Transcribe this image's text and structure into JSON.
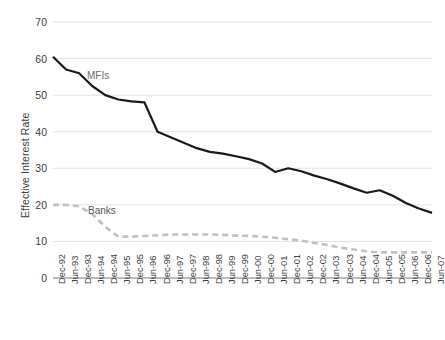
{
  "chart_data": {
    "type": "line",
    "title": "",
    "xlabel": "",
    "ylabel": "Effective Interest Rate",
    "ylim": [
      0,
      70
    ],
    "yticks": [
      0,
      10,
      20,
      30,
      40,
      50,
      60,
      70
    ],
    "grid": true,
    "legend_position": "inline-annotation",
    "categories": [
      "Dec-92",
      "Jun-93",
      "Dec-93",
      "Jun-94",
      "Dec-94",
      "Jun-95",
      "Dec-95",
      "Jun-96",
      "Dec-96",
      "Jun-97",
      "Dec-97",
      "Jun-98",
      "Dec-98",
      "Jun-99",
      "Dec-99",
      "Jun-00",
      "Dec-00",
      "Jun-01",
      "Dec-01",
      "Jun-02",
      "Dec-02",
      "Jun-03",
      "Dec-03",
      "Jun-04",
      "Dec-04",
      "Jun-05",
      "Dec-05",
      "Jun-06",
      "Dec-06",
      "Jun-07"
    ],
    "series": [
      {
        "name": "MFIs",
        "style": "solid",
        "color": "#1a1a1a",
        "values": [
          60.5,
          57.0,
          56.0,
          52.5,
          50.0,
          48.8,
          48.3,
          48.0,
          40.0,
          38.5,
          37.0,
          35.5,
          34.5,
          34.0,
          33.3,
          32.5,
          31.3,
          29.0,
          30.0,
          29.2,
          28.0,
          27.0,
          25.8,
          24.5,
          23.3,
          24.0,
          22.5,
          20.5,
          19.0,
          17.8
        ]
      },
      {
        "name": "Banks",
        "style": "dashed",
        "color": "#c2c2c2",
        "values": [
          20.0,
          20.0,
          19.6,
          17.5,
          14.0,
          11.3,
          11.3,
          11.5,
          11.7,
          11.9,
          11.9,
          11.9,
          11.9,
          11.8,
          11.6,
          11.5,
          11.3,
          11.0,
          10.6,
          10.2,
          9.6,
          9.0,
          8.3,
          7.8,
          7.3,
          7.0,
          7.0,
          7.0,
          7.0,
          7.0
        ]
      }
    ],
    "annotations": [
      {
        "text": "MFIs",
        "series": "MFIs"
      },
      {
        "text": "Banks",
        "series": "Banks"
      }
    ]
  },
  "axis": {
    "y_title": "Effective Interest Rate"
  },
  "colors": {
    "mfis_line": "#1a1a1a",
    "banks_line": "#c2c2c2",
    "gridline": "#e2e2e2",
    "axis_line": "#a6a6a6",
    "text": "#404040"
  }
}
